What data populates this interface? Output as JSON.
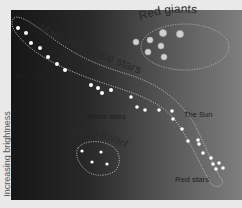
{
  "axis": {
    "y_label": "Increasing brightness"
  },
  "regions": {
    "red_giants": "Red giants",
    "main_sequence": "Main sequence stars",
    "white_dwarfs": "White dwarfs"
  },
  "labels": {
    "blue_stars": "Blue stars",
    "yellow_stars": "Yellow stars",
    "the_sun": "The Sun",
    "red_stars": "Red stars"
  },
  "colors": {
    "panel_dark": "#161616",
    "panel_light": "#7e7e7e",
    "star_white": "#ffffff",
    "giant_star": "#cfcfcf",
    "outline": "#c8c8c8",
    "label_dark": "#2a2a2a"
  }
}
